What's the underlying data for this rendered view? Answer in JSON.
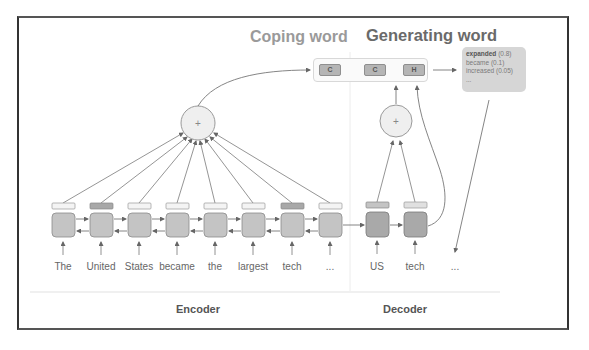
{
  "titles": {
    "coping": "Coping word",
    "generating": "Generating word"
  },
  "output_chips": [
    {
      "label": "C",
      "x": 5
    },
    {
      "label": "C",
      "x": 50
    },
    {
      "label": "H",
      "x": 90
    }
  ],
  "probabilities": {
    "rows": [
      {
        "word": "expanded",
        "prob": "(0.8)"
      },
      {
        "word": "became",
        "prob": "(0.1)"
      },
      {
        "word": "increased",
        "prob": "(0.05)"
      },
      {
        "word": "...",
        "prob": ""
      }
    ]
  },
  "encoder": {
    "label": "Encoder",
    "tokens": [
      "The",
      "United",
      "States",
      "became",
      "the",
      "largest",
      "tech",
      "..."
    ],
    "highlighted": [
      1,
      6
    ]
  },
  "decoder": {
    "label": "Decoder",
    "tokens": [
      "US",
      "tech",
      "..."
    ]
  },
  "operators": {
    "encoder_sum": "+",
    "decoder_sum": "+"
  },
  "colors": {
    "cell": "#c4c4c4",
    "cell_border": "#8a8a8a",
    "decoder_cell": "#a9a9a9",
    "bar_light": "#f4f4f4",
    "bar_dark": "#a8a8a8",
    "arrow": "#707070"
  }
}
